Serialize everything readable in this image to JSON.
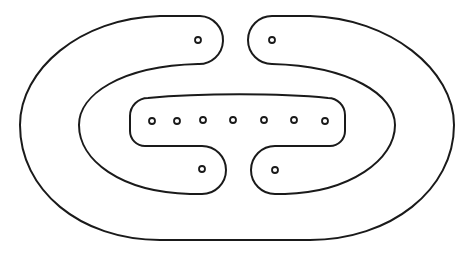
{
  "diagram": {
    "type": "outline-drawing",
    "stroke_color": "#1a1a1a",
    "background_color": "#ffffff",
    "stroke_width": 2,
    "hole_radius": 3,
    "holes": {
      "top_left_arm": {
        "x": 198,
        "y": 40
      },
      "top_right_arm": {
        "x": 272,
        "y": 40
      },
      "bottom_left_arm": {
        "x": 202,
        "y": 169
      },
      "bottom_right_arm": {
        "x": 275,
        "y": 170
      },
      "center_bar_row_y": 121,
      "center_bar_x": [
        152,
        177,
        203,
        233,
        264,
        294,
        325
      ]
    },
    "hole_count": 11
  }
}
